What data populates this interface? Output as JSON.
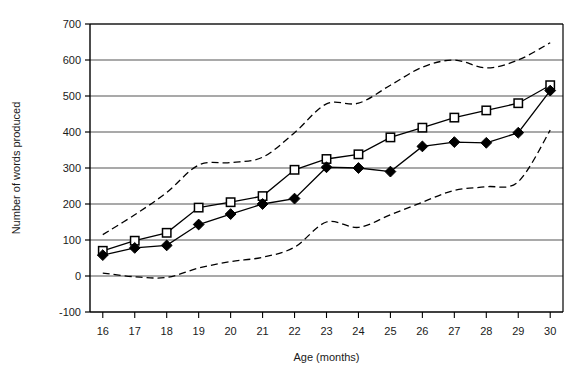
{
  "chart_data": {
    "type": "line",
    "title": "",
    "subtitle": "",
    "xlabel": "Age (months)",
    "ylabel": "Number of words produced",
    "x": [
      16,
      17,
      18,
      19,
      20,
      21,
      22,
      23,
      24,
      25,
      26,
      27,
      28,
      29,
      30
    ],
    "xticklabels": [
      "16",
      "17",
      "18",
      "19",
      "20",
      "21",
      "22",
      "23",
      "24",
      "25",
      "26",
      "27",
      "28",
      "29",
      "30"
    ],
    "yticklabels": [
      "-100",
      "0",
      "100",
      "200",
      "300",
      "400",
      "500",
      "600",
      "700"
    ],
    "yticks": [
      -100,
      0,
      100,
      200,
      300,
      400,
      500,
      600,
      700
    ],
    "xlim": [
      15.6,
      30.4
    ],
    "ylim": [
      -100,
      700
    ],
    "grid": "horizontal",
    "legend": "none",
    "series": [
      {
        "name": "open-square-series",
        "marker": "open-square",
        "linestyle": "solid",
        "color": "#000000",
        "values": [
          70,
          98,
          120,
          190,
          205,
          222,
          295,
          325,
          338,
          385,
          412,
          440,
          460,
          480,
          530
        ]
      },
      {
        "name": "filled-diamond-series",
        "marker": "filled-diamond",
        "linestyle": "solid",
        "color": "#000000",
        "values": [
          58,
          78,
          85,
          143,
          172,
          200,
          215,
          302,
          300,
          290,
          360,
          372,
          370,
          398,
          515
        ]
      },
      {
        "name": "upper-band",
        "marker": "none",
        "linestyle": "dashed",
        "color": "#000000",
        "values": [
          115,
          170,
          232,
          308,
          315,
          330,
          398,
          478,
          480,
          530,
          580,
          600,
          578,
          600,
          648
        ]
      },
      {
        "name": "lower-band",
        "marker": "none",
        "linestyle": "dashed",
        "color": "#000000",
        "values": [
          8,
          -2,
          -4,
          22,
          40,
          52,
          80,
          150,
          135,
          170,
          205,
          238,
          248,
          262,
          405
        ]
      }
    ]
  },
  "axes": {
    "x_title": "Age (months)",
    "y_title": "Number of words produced"
  }
}
